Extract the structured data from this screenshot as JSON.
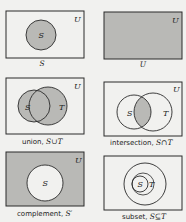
{
  "colors": {
    "background": "#f1f1ef",
    "shade": "#b9b9b6",
    "stroke": "#2a2a2a"
  },
  "panels": [
    {
      "id": "set-s",
      "universe_label": "U",
      "sets": [
        "S"
      ],
      "caption_text": "",
      "caption_symbol": "S"
    },
    {
      "id": "universe",
      "universe_label": "U",
      "sets": [],
      "caption_text": "",
      "caption_symbol": "U"
    },
    {
      "id": "union",
      "universe_label": "U",
      "sets": [
        "S",
        "T"
      ],
      "caption_text": "union, ",
      "caption_symbol": "S∪T"
    },
    {
      "id": "intersection",
      "universe_label": "U",
      "sets": [
        "S",
        "T"
      ],
      "caption_text": "intersection, ",
      "caption_symbol": "S∩T"
    },
    {
      "id": "complement",
      "universe_label": "U",
      "sets": [
        "S"
      ],
      "caption_text": "complement, ",
      "caption_symbol": "S′"
    },
    {
      "id": "subset",
      "universe_label": "",
      "sets": [
        "S",
        "T"
      ],
      "caption_text": "subset, ",
      "caption_symbol": "S⊆T"
    }
  ]
}
